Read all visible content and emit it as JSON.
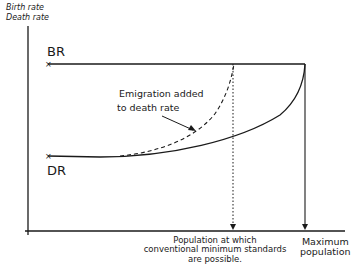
{
  "diagram": {
    "y_axis_title_line1": "Birth rate",
    "y_axis_title_line2": "Death rate",
    "curves": {
      "birth_rate_label": "BR",
      "death_rate_label": "DR"
    },
    "annotation": {
      "line1": "Emigration added",
      "line2": "to death rate"
    },
    "x_markers": {
      "min_standards_line1": "Population at which",
      "min_standards_line2": "conventional minimum standards",
      "min_standards_line3": "are possible.",
      "max_pop_line1": "Maximum",
      "max_pop_line2": "population"
    },
    "colors": {
      "ink": "#1a1a1a",
      "background": "#ffffff"
    }
  }
}
